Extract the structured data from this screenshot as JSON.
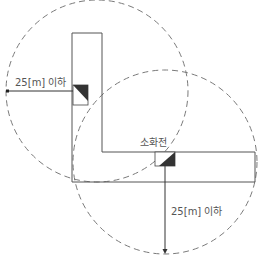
{
  "diagram": {
    "labels": {
      "left_distance": "25[m] 이하",
      "hydrant": "소화전",
      "bottom_distance": "25[m] 이하"
    },
    "colors": {
      "corridor_stroke": "#555555",
      "circle_stroke": "#777777",
      "hydrant_fill": "#333333",
      "arrow": "#333333",
      "text": "#555555"
    },
    "elements": {
      "circle_1": {
        "cx": 97,
        "cy": 91,
        "r": 91,
        "style": "dashed"
      },
      "circle_2": {
        "cx": 165,
        "cy": 162,
        "r": 92,
        "style": "dashed"
      },
      "corridor": {
        "shape": "L",
        "vertical_arm": [
          72,
          33,
          102,
          182
        ],
        "horizontal_arm": [
          72,
          152,
          255,
          182
        ]
      },
      "hydrant_1": {
        "x": 73,
        "y": 85,
        "w": 15,
        "h": 20
      },
      "hydrant_2": {
        "x": 155,
        "y": 152,
        "w": 20,
        "h": 14
      }
    }
  }
}
